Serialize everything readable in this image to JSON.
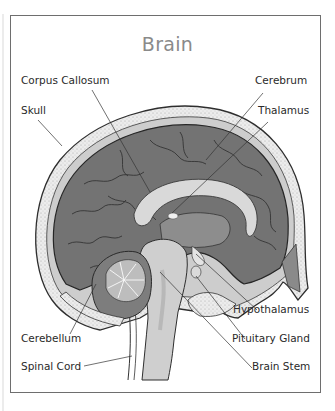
{
  "diagram": {
    "title": "Brain",
    "labels": {
      "corpus_callosum": "Corpus Callosum",
      "cerebrum": "Cerebrum",
      "skull": "Skull",
      "thalamus": "Thalamus",
      "hypothalamus": "Hypothalamus",
      "cerebellum": "Cerebellum",
      "pituitary_gland": "Pituitary Gland",
      "spinal_cord": "Spinal Cord",
      "brain_stem": "Brain Stem"
    },
    "colors": {
      "frame": "#6e6e6e",
      "title": "#8a8a8a",
      "cerebrum": "#707070",
      "skull": "#e8e8e8",
      "corpus_callosum": "#d9d9d9",
      "stem": "#cfcfcf",
      "leader_line": "#333333"
    }
  }
}
